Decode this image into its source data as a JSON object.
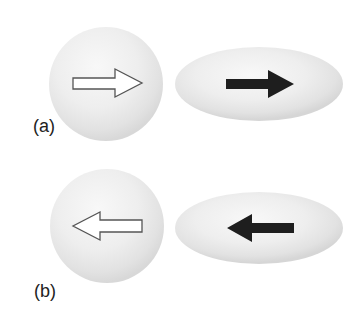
{
  "figure": {
    "panels": [
      {
        "label": "(a)",
        "sphere": {
          "cx": 106,
          "cy": 84,
          "r": 57,
          "arrow_style": "outline",
          "arrow_direction": "right"
        },
        "ellipsoid": {
          "cx": 259,
          "cy": 84,
          "rx": 84,
          "ry": 37,
          "arrow_style": "filled",
          "arrow_direction": "right"
        }
      },
      {
        "label": "(b)",
        "sphere": {
          "cx": 107,
          "cy": 226,
          "r": 57,
          "arrow_style": "outline",
          "arrow_direction": "left"
        },
        "ellipsoid": {
          "cx": 259,
          "cy": 228,
          "rx": 84,
          "ry": 36,
          "arrow_style": "filled",
          "arrow_direction": "left"
        }
      }
    ],
    "colors": {
      "shape_highlight": "#f7f7f7",
      "shape_mid": "#ececec",
      "shape_edge": "#d6d6d6",
      "outline_arrow_fill": "#ffffff",
      "outline_arrow_stroke": "#555555",
      "filled_arrow": "#1e1e1e",
      "label_text": "#222222"
    },
    "icons": {
      "outline_arrow": "hollow-arrow-icon",
      "filled_arrow": "solid-arrow-icon"
    }
  }
}
